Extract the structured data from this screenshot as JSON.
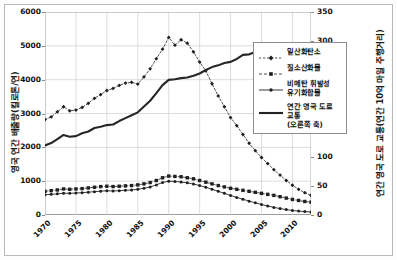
{
  "chart_data": {
    "type": "line",
    "title": "",
    "xlabel": "",
    "ylabel": "영국 연간 배출량(킬로톤/연)",
    "ylabel_right": "연간 영국 도로 교통(연간 10억 마일 주행거리)",
    "xlim": [
      1970,
      2013
    ],
    "ylim": [
      0,
      6000
    ],
    "ylim_right": [
      0,
      350
    ],
    "grid": true,
    "legend_position": "center-right",
    "xticks": [
      "1970",
      "1975",
      "1980",
      "1985",
      "1990",
      "1995",
      "2000",
      "2005",
      "2010"
    ],
    "xtick_values": [
      1970,
      1975,
      1980,
      1985,
      1990,
      1995,
      2000,
      2005,
      2010
    ],
    "yticks_left": [
      "0",
      "1000",
      "2000",
      "3000",
      "4000",
      "5000",
      "6000"
    ],
    "ytick_values_left": [
      0,
      1000,
      2000,
      3000,
      4000,
      5000,
      6000
    ],
    "yticks_right": [
      "0",
      "50",
      "100",
      "150",
      "200",
      "250",
      "300",
      "350"
    ],
    "ytick_values_right": [
      0,
      50,
      100,
      150,
      200,
      250,
      300,
      350
    ],
    "x": [
      1970,
      1971,
      1972,
      1973,
      1974,
      1975,
      1976,
      1977,
      1978,
      1979,
      1980,
      1981,
      1982,
      1983,
      1984,
      1985,
      1986,
      1987,
      1988,
      1989,
      1990,
      1991,
      1992,
      1993,
      1994,
      1995,
      1996,
      1997,
      1998,
      1999,
      2000,
      2001,
      2002,
      2003,
      2004,
      2005,
      2006,
      2007,
      2008,
      2009,
      2010,
      2011,
      2012,
      2013
    ],
    "series": [
      {
        "name": "일산화탄소",
        "axis": "left",
        "style": "dotted-with-markers",
        "marker": "diamond",
        "color": "#333333",
        "values": [
          2820,
          2900,
          3050,
          3200,
          3080,
          3100,
          3180,
          3300,
          3450,
          3560,
          3680,
          3740,
          3830,
          3900,
          3920,
          3870,
          4080,
          4320,
          4620,
          4900,
          5250,
          5020,
          5180,
          5080,
          4820,
          4520,
          4260,
          3880,
          3520,
          3200,
          2880,
          2640,
          2380,
          2120,
          1900,
          1700,
          1520,
          1340,
          1180,
          1020,
          880,
          760,
          660,
          580
        ]
      },
      {
        "name": "질소산화물",
        "axis": "left",
        "style": "dashed-with-markers",
        "marker": "square",
        "color": "#222222",
        "values": [
          700,
          720,
          740,
          770,
          760,
          770,
          780,
          800,
          820,
          840,
          850,
          840,
          850,
          860,
          870,
          890,
          920,
          960,
          1020,
          1100,
          1150,
          1140,
          1130,
          1100,
          1070,
          1020,
          970,
          920,
          870,
          830,
          790,
          760,
          730,
          700,
          670,
          640,
          610,
          580,
          540,
          500,
          460,
          430,
          400,
          380
        ]
      },
      {
        "name": "비메탄 휘발성 유기화합물",
        "axis": "left",
        "style": "solid-with-markers",
        "marker": "circle",
        "color": "#222222",
        "values": [
          600,
          610,
          625,
          645,
          640,
          650,
          660,
          675,
          690,
          705,
          715,
          710,
          720,
          730,
          740,
          760,
          790,
          830,
          890,
          960,
          1000,
          990,
          975,
          950,
          915,
          870,
          820,
          760,
          700,
          640,
          580,
          520,
          465,
          410,
          360,
          310,
          265,
          225,
          190,
          160,
          135,
          115,
          100,
          90
        ]
      },
      {
        "name": "연간 영국 도로 교통 (오른쪽 축)",
        "axis": "right",
        "style": "solid-thick",
        "marker": "none",
        "values": [
          120,
          124,
          131,
          138,
          135,
          136,
          141,
          144,
          150,
          152,
          155,
          156,
          162,
          167,
          172,
          177,
          187,
          197,
          210,
          224,
          233,
          234,
          236,
          237,
          240,
          244,
          250,
          255,
          258,
          262,
          264,
          269,
          276,
          277,
          281,
          284,
          287,
          291,
          289,
          288,
          286,
          285,
          287,
          290
        ]
      }
    ]
  },
  "legend": {
    "items": [
      {
        "label": "일산화탄소",
        "label_line2": ""
      },
      {
        "label": "질소산화물",
        "label_line2": ""
      },
      {
        "label": "비메탄 휘발성",
        "label_line2": "유기화합물"
      },
      {
        "label": "연간 영국 도로 교통",
        "label_line2": "(오른쪽 축)"
      }
    ]
  }
}
